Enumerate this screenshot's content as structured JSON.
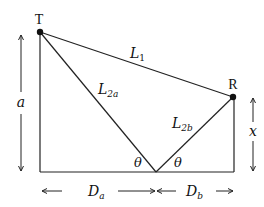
{
  "diagram": {
    "type": "two-ray ground reflection geometry",
    "colors": {
      "line": "#222222",
      "background": "#ffffff"
    },
    "points": {
      "transmitter": {
        "label": "T",
        "x": 40,
        "y": 32
      },
      "receiver": {
        "label": "R",
        "x": 233,
        "y": 97
      },
      "reflection": {
        "x": 156,
        "y": 172
      }
    },
    "segments": {
      "direct": {
        "label": "L",
        "sub": "1"
      },
      "incident": {
        "label": "L",
        "sub": "2a"
      },
      "reflected": {
        "label": "L",
        "sub": "2b"
      }
    },
    "angles": {
      "left": "θ",
      "right": "θ"
    },
    "dimensions": {
      "tx_height": "a",
      "rx_height": "x",
      "dist_a": {
        "label": "D",
        "sub": "a"
      },
      "dist_b": {
        "label": "D",
        "sub": "b"
      }
    }
  }
}
